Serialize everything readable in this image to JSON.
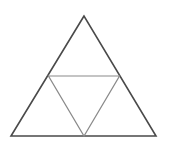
{
  "diagram": {
    "type": "triangle-subdivision",
    "outer_triangle": {
      "apex": [
        84,
        16
      ],
      "bottom_left": [
        11,
        136
      ],
      "bottom_right": [
        156,
        136
      ],
      "stroke": "#4a4a4a",
      "stroke_width": 1.6
    },
    "inner_triangle": {
      "left_mid": [
        48.5,
        76
      ],
      "right_mid": [
        119.5,
        76
      ],
      "bottom_mid": [
        84,
        136
      ],
      "stroke": "#8a8a8a",
      "stroke_width": 1.2
    },
    "background": "#ffffff"
  }
}
